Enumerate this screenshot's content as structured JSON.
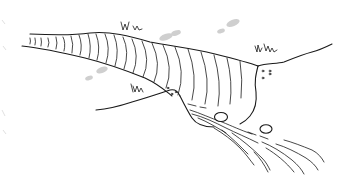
{
  "illustration": {
    "title": "Glacier valley sketch",
    "style": "black line drawing on white",
    "elements": [
      "glacier-tongue",
      "crevasse-lines",
      "left-hillside",
      "right-hillside",
      "grass-tufts",
      "meltwater-stream",
      "boulders",
      "gray-clouds",
      "pebbles"
    ]
  },
  "colors": {
    "background": "#ffffff",
    "ink": "#1a1a1a",
    "cloud": "#cfcfcf"
  }
}
